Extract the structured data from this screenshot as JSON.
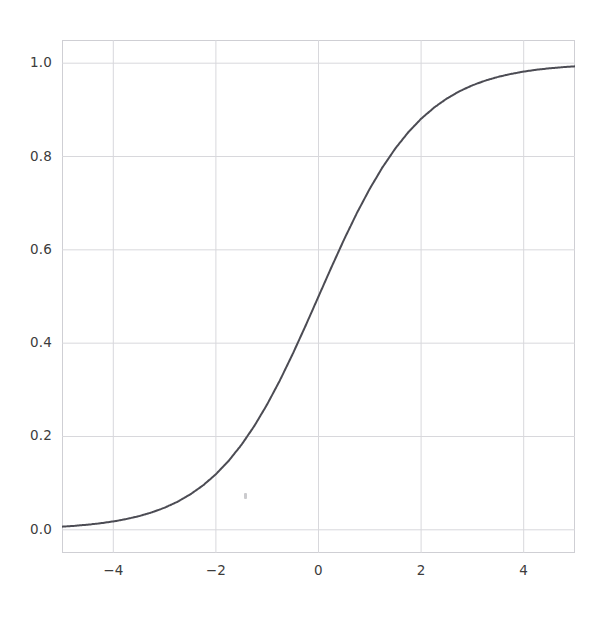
{
  "figure": {
    "background_color": "#ffffff",
    "axes_edge_color": "#cfcfd4",
    "grid_color": "#d8d8dc",
    "tick_label_color": "#3c3c3c",
    "artifact_name": "faint-speck"
  },
  "chart_data": {
    "type": "line",
    "title": "",
    "subtitle": "",
    "xlabel": "",
    "ylabel": "",
    "grid": true,
    "legend": false,
    "legend_position": "none",
    "xlim": [
      -5.0,
      5.0
    ],
    "ylim": [
      -0.0497,
      1.0497
    ],
    "xticks": [
      -4,
      -2,
      0,
      2,
      4
    ],
    "yticks": [
      0.0,
      0.2,
      0.4,
      0.6,
      0.8,
      1.0
    ],
    "xtick_labels": [
      "−4",
      "−2",
      "0",
      "2",
      "4"
    ],
    "ytick_labels": [
      "0.0",
      "0.2",
      "0.4",
      "0.6",
      "0.8",
      "1.0"
    ],
    "series": [
      {
        "name": "sigmoid",
        "color": "#4c4c54",
        "linewidth": 2.0,
        "formula": "1 / (1 + exp(-x))",
        "x": [
          -5.0,
          -4.75,
          -4.5,
          -4.25,
          -4.0,
          -3.75,
          -3.5,
          -3.25,
          -3.0,
          -2.75,
          -2.5,
          -2.25,
          -2.0,
          -1.75,
          -1.5,
          -1.25,
          -1.0,
          -0.75,
          -0.5,
          -0.25,
          0.0,
          0.25,
          0.5,
          0.75,
          1.0,
          1.25,
          1.5,
          1.75,
          2.0,
          2.25,
          2.5,
          2.75,
          3.0,
          3.25,
          3.5,
          3.75,
          4.0,
          4.25,
          4.5,
          4.75,
          5.0
        ],
        "values": [
          0.0067,
          0.0086,
          0.011,
          0.014,
          0.018,
          0.023,
          0.0293,
          0.0373,
          0.0474,
          0.0601,
          0.0759,
          0.0953,
          0.1192,
          0.148,
          0.1824,
          0.2227,
          0.2689,
          0.3208,
          0.3775,
          0.4378,
          0.5,
          0.5622,
          0.6225,
          0.6792,
          0.7311,
          0.7773,
          0.8176,
          0.852,
          0.8808,
          0.9047,
          0.9241,
          0.9399,
          0.9526,
          0.9627,
          0.9707,
          0.977,
          0.982,
          0.986,
          0.989,
          0.9914,
          0.9933
        ]
      }
    ]
  }
}
